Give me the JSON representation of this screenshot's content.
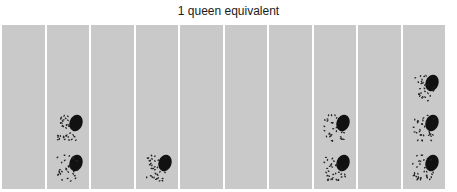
{
  "title": "1 queen equivalent",
  "icon": "bee-cluster-icon",
  "colors": {
    "column": "#c9c9c9",
    "cluster": "#111111"
  },
  "columns": [
    {
      "clusters": 0
    },
    {
      "clusters": 2
    },
    {
      "clusters": 0
    },
    {
      "clusters": 1
    },
    {
      "clusters": 0
    },
    {
      "clusters": 0
    },
    {
      "clusters": 0
    },
    {
      "clusters": 2
    },
    {
      "clusters": 0
    },
    {
      "clusters": 3
    }
  ]
}
